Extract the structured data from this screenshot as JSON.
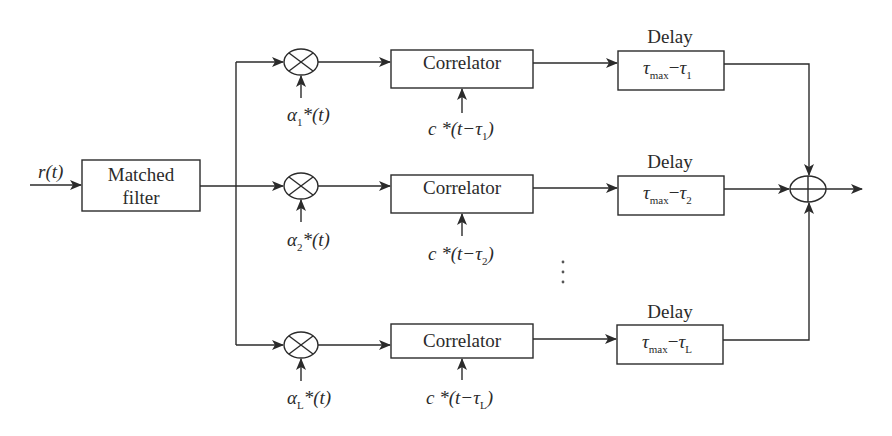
{
  "diagram": {
    "type": "rake-receiver-block-diagram",
    "input": {
      "label": "r(t)"
    },
    "matched_filter": {
      "line1": "Matched",
      "line2": "filter"
    },
    "branches": [
      {
        "index": "1",
        "multiplier_input": {
          "sym": "α",
          "sub": "1",
          "rest": "*(t)"
        },
        "correlator": {
          "label": "Correlator"
        },
        "code_input": {
          "prefix": "c *(t−",
          "tau": "τ",
          "sub": "1",
          "suffix": ")"
        },
        "delay": {
          "title": "Delay",
          "tau": "τ",
          "max": "max",
          "minus": "−",
          "tau2": "τ",
          "sub": "1"
        }
      },
      {
        "index": "2",
        "multiplier_input": {
          "sym": "α",
          "sub": "2",
          "rest": "*(t)"
        },
        "correlator": {
          "label": "Correlator"
        },
        "code_input": {
          "prefix": "c *(t−",
          "tau": "τ",
          "sub": "2",
          "suffix": ")"
        },
        "delay": {
          "title": "Delay",
          "tau": "τ",
          "max": "max",
          "minus": "−",
          "tau2": "τ",
          "sub": "2"
        }
      },
      {
        "index": "L",
        "multiplier_input": {
          "sym": "α",
          "sub": "L",
          "rest": "*(t)"
        },
        "correlator": {
          "label": "Correlator"
        },
        "code_input": {
          "prefix": "c *(t−",
          "tau": "τ",
          "sub": "L",
          "suffix": ")"
        },
        "delay": {
          "title": "Delay",
          "tau": "τ",
          "max": "max",
          "minus": "−",
          "tau2": "τ",
          "sub": "L"
        }
      }
    ],
    "ellipsis": "⋮",
    "summer": {
      "symbol": "⊕"
    },
    "colors": {
      "stroke": "#2b2b2b",
      "background": "#ffffff"
    }
  }
}
